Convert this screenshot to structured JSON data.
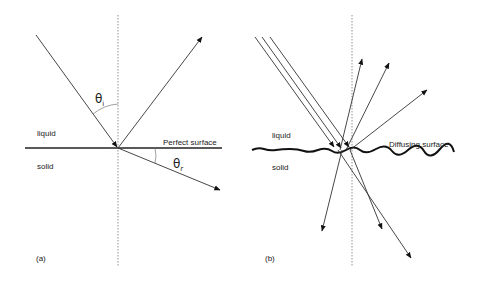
{
  "figure": {
    "panel_a": {
      "label": "(a)",
      "medium_top": "liquid",
      "medium_bottom": "solid",
      "surface_label": "Perfect surface",
      "angle_incident": "θ",
      "angle_incident_sub": "i",
      "angle_refracted": "θ",
      "angle_refracted_sub": "r"
    },
    "panel_b": {
      "label": "(b)",
      "medium_top": "liquid",
      "medium_bottom": "solid",
      "surface_label": "Diffusing surface"
    },
    "colors": {
      "line": "#333333",
      "surface": "#111111",
      "normal": "#777777"
    }
  }
}
